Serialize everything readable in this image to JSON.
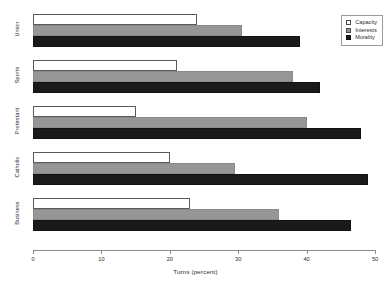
{
  "chart_data": {
    "type": "bar",
    "orientation": "horizontal",
    "title": "",
    "xlabel": "Turns (percent)",
    "ylabel": "",
    "xlim": [
      0,
      50
    ],
    "xticks": [
      0,
      10,
      20,
      30,
      40,
      50
    ],
    "xticklabels": [
      "0",
      "10",
      "20",
      "30",
      "40",
      "50"
    ],
    "grid": false,
    "legend_position": "top-right",
    "categories": [
      "Union",
      "Sports",
      "Protestant",
      "Catholic",
      "Business"
    ],
    "series": [
      {
        "name": "Capacity",
        "color": "#ffffff",
        "values": [
          24.0,
          21.0,
          15.0,
          20.0,
          23.0
        ]
      },
      {
        "name": "Interests",
        "color": "#969696",
        "values": [
          30.5,
          38.0,
          40.0,
          29.5,
          36.0
        ]
      },
      {
        "name": "Morality",
        "color": "#1a1a1a",
        "values": [
          39.0,
          42.0,
          48.0,
          49.0,
          46.5
        ]
      }
    ]
  },
  "legend": {
    "items": [
      {
        "label": "Capacity",
        "swatch": "capacity"
      },
      {
        "label": "Interests",
        "swatch": "interests"
      },
      {
        "label": "Morality",
        "swatch": "morality"
      }
    ]
  },
  "axis": {
    "x_title": "Turns (percent)"
  }
}
